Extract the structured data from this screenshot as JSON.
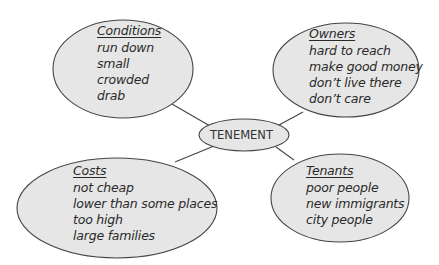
{
  "diagram": {
    "type": "concept-web",
    "colors": {
      "bubble_fill": "#e6e6e6",
      "bubble_stroke": "#444444",
      "connector": "#444444",
      "text": "#2a2a2a",
      "background": "#ffffff"
    },
    "center": {
      "label": "TENEMENT"
    },
    "nodes": [
      {
        "id": "conditions",
        "heading": "Conditions",
        "items": [
          "run down",
          "small",
          "crowded",
          "drab"
        ]
      },
      {
        "id": "owners",
        "heading": "Owners",
        "items": [
          "hard to reach",
          "make good money",
          "don’t live there",
          "don’t care"
        ]
      },
      {
        "id": "costs",
        "heading": "Costs",
        "items": [
          "not cheap",
          "lower than some places",
          "too high",
          "large families"
        ]
      },
      {
        "id": "tenants",
        "heading": "Tenants",
        "items": [
          "poor people",
          "new immigrants",
          "city people"
        ]
      }
    ]
  }
}
